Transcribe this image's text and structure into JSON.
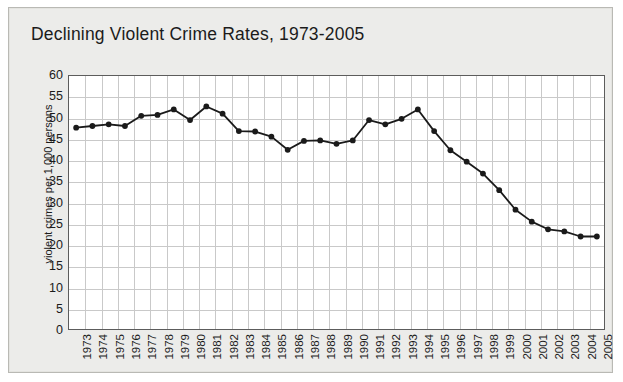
{
  "figure": {
    "title": "Declining Violent Crime Rates, 1973-2005",
    "background_color": "#ececea",
    "plot_background_color": "#ffffff",
    "line_color": "#1a1a1a",
    "grid_color": "#c9c9c9",
    "axis_color": "#5c5c5c"
  },
  "chart_data": {
    "type": "line",
    "title": "Declining Violent Crime Rates, 1973-2005",
    "xlabel": "",
    "ylabel": "violent crimes per 1,000 persons",
    "ylim": [
      0,
      60
    ],
    "ytick_step": 5,
    "yticks": [
      0,
      5,
      10,
      15,
      20,
      25,
      30,
      35,
      40,
      45,
      50,
      55,
      60
    ],
    "grid": true,
    "legend": false,
    "marker": "circle",
    "categories": [
      "1973",
      "1974",
      "1975",
      "1976",
      "1977",
      "1978",
      "1979",
      "1980",
      "1981",
      "1982",
      "1983",
      "1984",
      "1985",
      "1986",
      "1987",
      "1988",
      "1989",
      "1990",
      "1991",
      "1992",
      "1993",
      "1994",
      "1995",
      "1996",
      "1997",
      "1998",
      "1999",
      "2000",
      "2001",
      "2002",
      "2003",
      "2004",
      "2005"
    ],
    "values": [
      47.6,
      48.0,
      48.4,
      48.0,
      50.4,
      50.6,
      51.9,
      49.4,
      52.6,
      50.9,
      46.8,
      46.7,
      45.5,
      42.4,
      44.5,
      44.6,
      43.8,
      44.6,
      49.4,
      48.4,
      49.7,
      51.9,
      46.8,
      42.3,
      39.6,
      36.8,
      32.9,
      28.3,
      25.5,
      23.7,
      23.2,
      22.0,
      22.0
    ]
  }
}
